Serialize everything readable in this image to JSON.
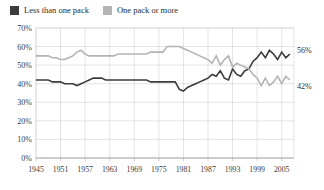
{
  "legend": {
    "position": "top-left",
    "entries": [
      {
        "label": "Less than one pack",
        "color": "#3c3c3c",
        "swatch_name": "legend-swatch-dark"
      },
      {
        "label": "One pack or more",
        "color": "#b4b4b4",
        "swatch_name": "legend-swatch-gray"
      }
    ]
  },
  "end_labels": [
    {
      "text": "56%",
      "series": "Less than one pack",
      "value": 56
    },
    {
      "text": "42%",
      "series": "One pack or more",
      "value": 42
    }
  ],
  "chart_data": {
    "type": "line",
    "title": "",
    "subtitle": "",
    "xlabel": "",
    "ylabel": "",
    "xlim": [
      1945,
      2008
    ],
    "ylim": [
      0,
      70
    ],
    "grid": true,
    "legend_position": "top-left",
    "ytick_labels": [
      "0%",
      "10%",
      "20%",
      "30%",
      "40%",
      "50%",
      "60%",
      "70%"
    ],
    "ytick_values": [
      0,
      10,
      20,
      30,
      40,
      50,
      60,
      70
    ],
    "xtick_labels": [
      "1945",
      "1951",
      "1957",
      "1963",
      "1969",
      "1975",
      "1981",
      "1987",
      "1993",
      "1999",
      "2005"
    ],
    "xtick_values": [
      1945,
      1951,
      1957,
      1963,
      1969,
      1975,
      1981,
      1987,
      1993,
      1999,
      2005
    ],
    "x": [
      1945,
      1946,
      1947,
      1948,
      1949,
      1950,
      1951,
      1952,
      1953,
      1954,
      1955,
      1956,
      1957,
      1958,
      1959,
      1960,
      1961,
      1962,
      1963,
      1964,
      1965,
      1966,
      1967,
      1968,
      1969,
      1970,
      1971,
      1972,
      1973,
      1974,
      1975,
      1976,
      1977,
      1978,
      1979,
      1980,
      1981,
      1982,
      1983,
      1984,
      1985,
      1986,
      1987,
      1988,
      1989,
      1990,
      1991,
      1992,
      1993,
      1994,
      1995,
      1996,
      1997,
      1998,
      1999,
      2000,
      2001,
      2002,
      2003,
      2004,
      2005,
      2006,
      2007
    ],
    "series": [
      {
        "name": "Less than one pack",
        "color": "#3c3c3c",
        "width": 1.6,
        "values": [
          42,
          42,
          42,
          42,
          41,
          41,
          41,
          40,
          40,
          40,
          39,
          40,
          41,
          42,
          43,
          43,
          43,
          42,
          42,
          42,
          42,
          42,
          42,
          42,
          42,
          42,
          42,
          42,
          41,
          41,
          41,
          41,
          41,
          41,
          41,
          37,
          36,
          38,
          39,
          40,
          41,
          42,
          43,
          45,
          44,
          47,
          43,
          42,
          48,
          45,
          44,
          47,
          48,
          52,
          54,
          57,
          54,
          58,
          56,
          53,
          57,
          54,
          56
        ]
      },
      {
        "name": "One pack or more",
        "color": "#b4b4b4",
        "width": 1.6,
        "values": [
          55,
          55,
          55,
          55,
          54,
          54,
          53,
          53,
          54,
          55,
          57,
          58,
          56,
          55,
          55,
          55,
          55,
          55,
          55,
          55,
          56,
          56,
          56,
          56,
          56,
          56,
          56,
          56,
          57,
          57,
          57,
          57,
          60,
          60,
          60,
          60,
          59,
          58,
          57,
          56,
          55,
          54,
          53,
          51,
          55,
          50,
          53,
          55,
          49,
          51,
          50,
          49,
          48,
          45,
          43,
          39,
          43,
          39,
          41,
          44,
          40,
          44,
          42
        ]
      }
    ]
  }
}
